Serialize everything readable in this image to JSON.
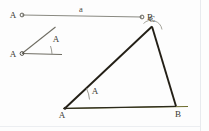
{
  "figure": {
    "background_color": "#fdfdfd",
    "panel_border_color": "#e8eaee",
    "colors": {
      "given_segment": "#8a8a82",
      "given_angle_ray": "#6e6c62",
      "triangle_stroke": "#231f16",
      "baseline": "#6b6a2a",
      "arc": "#8f8d84",
      "label_text": "#3b3a33",
      "vertex_dot": "#2b2821"
    },
    "given_segment": {
      "name": "segment-a",
      "length_label": "a",
      "start_label": "A",
      "end_label": "B",
      "start_point": [
        22,
        15
      ],
      "end_point": [
        142,
        17
      ]
    },
    "given_angle": {
      "name": "angle-A-given",
      "vertex_label": "A",
      "angle_label": "A",
      "vertex_point": [
        22,
        53
      ],
      "ray_horizontal_end": [
        62,
        54
      ],
      "ray_slanted_end": [
        55,
        27
      ],
      "arc_label_position": [
        52,
        40
      ]
    },
    "triangle": {
      "name": "triangle-ABC",
      "vertices": [
        {
          "label": "A",
          "point": [
            65,
            108
          ]
        },
        {
          "label": "B",
          "point": [
            176,
            106
          ]
        },
        {
          "label": "C",
          "point": [
            152,
            26
          ]
        }
      ],
      "angle_marked_at": "A",
      "angle_label": "A",
      "angle_label_position": [
        95,
        92
      ],
      "baseline_extends_past_B": true
    },
    "construction_arc_at_C": {
      "name": "construction-arc-C",
      "center": [
        152,
        26
      ],
      "visible": true
    }
  }
}
